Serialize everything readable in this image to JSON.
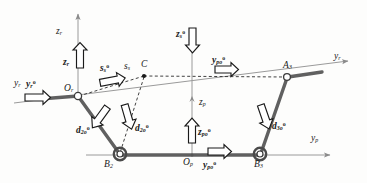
{
  "figure": {
    "type": "mechanism-kinematic-diagram",
    "stroke_color": "#2b2b2b",
    "link_color": "#555555",
    "axis_color": "#8a8a8a",
    "arrow_fill": "#ffffff",
    "arrow_stroke": "#1a1a1a",
    "background": "#fdfdfc",
    "width": 367,
    "height": 183
  },
  "axes": [
    {
      "id": "zr",
      "base": "z",
      "sub": "r",
      "sup": "",
      "label_x": 56,
      "label_y": 27
    },
    {
      "id": "yr_left",
      "base": "y",
      "sub": "r",
      "sup": "",
      "label_x": 14,
      "label_y": 79
    },
    {
      "id": "yr_right",
      "base": "y",
      "sub": "r",
      "sup": "",
      "label_x": 334,
      "label_y": 57
    },
    {
      "id": "zp",
      "base": "z",
      "sub": "p",
      "sup": "",
      "label_x": 199,
      "label_y": 100
    },
    {
      "id": "yp",
      "base": "y",
      "sub": "p",
      "sup": "",
      "label_x": 311,
      "label_y": 137
    }
  ],
  "points": [
    {
      "id": "Or",
      "base": "O",
      "sub": "r",
      "label_x": 66,
      "label_y": 82,
      "node_x": 78,
      "node_y": 96
    },
    {
      "id": "Op",
      "base": "O",
      "sub": "p",
      "label_x": 183,
      "label_y": 157,
      "node_x": 192,
      "node_y": 155
    },
    {
      "id": "C",
      "base": "C",
      "sub": "",
      "label_x": 141,
      "label_y": 62,
      "node_x": 144,
      "node_y": 76
    },
    {
      "id": "A3",
      "base": "A",
      "sub": "3",
      "label_x": 285,
      "label_y": 64,
      "node_x": 287,
      "node_y": 77
    },
    {
      "id": "B2",
      "base": "B",
      "sub": "2",
      "label_x": 104,
      "label_y": 159,
      "node_x": 119,
      "node_y": 155
    },
    {
      "id": "B3",
      "base": "B",
      "sub": "3",
      "label_x": 255,
      "label_y": 159,
      "node_x": 260,
      "node_y": 155
    }
  ],
  "vectors": [
    {
      "id": "zr_vec",
      "base": "z",
      "sub": "r",
      "sup": "",
      "label_x": 63,
      "label_y": 57,
      "dir": "up"
    },
    {
      "id": "yr_vec",
      "base": "y",
      "sub": "r",
      "sup": "o",
      "label_x": 26,
      "label_y": 87,
      "dir": "right"
    },
    {
      "id": "ss_vec",
      "base": "s",
      "sub": "s",
      "sup": "o",
      "label_x": 102,
      "label_y": 70,
      "dir": "right-up"
    },
    {
      "id": "ss_axis",
      "base": "s",
      "sub": "s",
      "sup": "",
      "label_x": 126,
      "label_y": 66,
      "dir": "line"
    },
    {
      "id": "zs_vec",
      "base": "z",
      "sub": "s",
      "sup": "o",
      "label_x": 178,
      "label_y": 32,
      "dir": "down"
    },
    {
      "id": "ypo_top",
      "base": "y",
      "sub": "po",
      "sup": "o",
      "label_x": 214,
      "label_y": 62,
      "dir": "right"
    },
    {
      "id": "zp_vec",
      "base": "z",
      "sub": "po",
      "sup": "o",
      "label_x": 198,
      "label_y": 129,
      "dir": "up"
    },
    {
      "id": "ypo_bot",
      "base": "y",
      "sub": "po",
      "sup": "o",
      "label_x": 205,
      "label_y": 163,
      "dir": "right"
    },
    {
      "id": "d2o_a",
      "base": "d",
      "sub": "2o",
      "sup": "o",
      "label_x": 80,
      "label_y": 127,
      "dir": "down-right"
    },
    {
      "id": "d2o_b",
      "base": "d",
      "sub": "2o",
      "sup": "o",
      "label_x": 136,
      "label_y": 126,
      "dir": "down-left"
    },
    {
      "id": "d3o",
      "base": "d",
      "sub": "3o",
      "sup": "o",
      "label_x": 273,
      "label_y": 124,
      "dir": "down-left"
    }
  ],
  "links": [
    {
      "id": "link-Or-B2",
      "from": "Or",
      "to": "B2"
    },
    {
      "id": "link-B2-B3",
      "from": "B2",
      "to": "B3"
    },
    {
      "id": "link-B3-A3",
      "from": "B3",
      "to": "A3"
    },
    {
      "id": "link-A3-end",
      "from": "A3",
      "to": "yr_right"
    }
  ]
}
